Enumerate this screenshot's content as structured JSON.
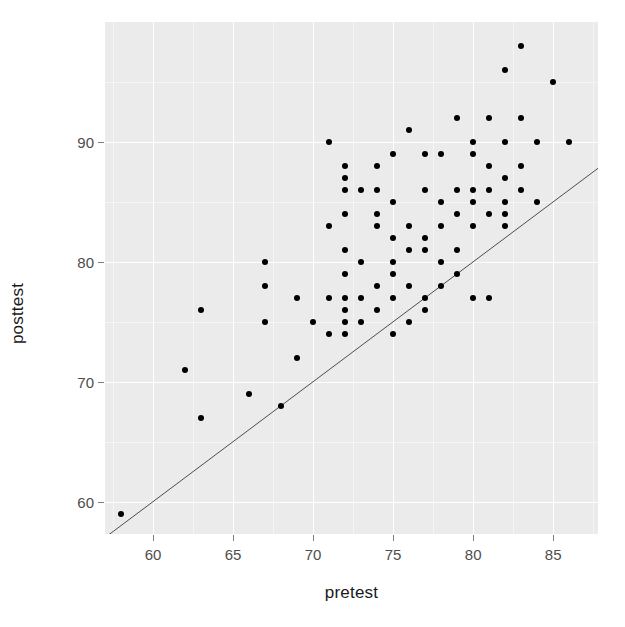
{
  "chart_data": {
    "type": "scatter",
    "title": "",
    "xlabel": "pretest",
    "ylabel": "posttest",
    "xlim": [
      57.0,
      87.8
    ],
    "ylim": [
      57.3,
      100.0
    ],
    "xticks": [
      60,
      65,
      70,
      75,
      80,
      85
    ],
    "yticks": [
      60,
      70,
      80,
      90
    ],
    "xminor": [
      57.5,
      62.5,
      67.5,
      72.5,
      77.5,
      82.5,
      87.5
    ],
    "yminor": [
      65,
      75,
      85,
      95
    ],
    "grid": true,
    "legend": null,
    "panel_background": "#ebebeb",
    "grid_major_color": "#ffffff",
    "grid_minor_color": "#f5f5f5",
    "point_color": "#000000",
    "point_size": 6,
    "annotations": [
      {
        "kind": "reference-line",
        "description": "identity line y = x",
        "from": [
          57.0,
          57.0
        ],
        "to": [
          87.8,
          87.8
        ],
        "color": "#4d4d4d",
        "width": 1
      }
    ],
    "x": [
      58,
      62,
      63,
      63,
      66,
      67,
      67,
      67,
      68,
      69,
      69,
      70,
      71,
      71,
      71,
      71,
      72,
      72,
      72,
      72,
      72,
      72,
      72,
      72,
      72,
      72,
      73,
      73,
      73,
      73,
      74,
      74,
      74,
      74,
      74,
      74,
      75,
      75,
      75,
      75,
      75,
      75,
      75,
      76,
      76,
      76,
      76,
      76,
      77,
      77,
      77,
      77,
      77,
      77,
      78,
      78,
      78,
      78,
      78,
      79,
      79,
      79,
      79,
      79,
      80,
      80,
      80,
      80,
      80,
      80,
      81,
      81,
      81,
      81,
      81,
      82,
      82,
      82,
      82,
      82,
      82,
      83,
      83,
      83,
      83,
      84,
      84,
      85,
      86
    ],
    "y": [
      59,
      71,
      76,
      67,
      69,
      80,
      78,
      75,
      68,
      77,
      72,
      75,
      90,
      83,
      77,
      74,
      88,
      87,
      86,
      84,
      81,
      79,
      77,
      76,
      75,
      74,
      86,
      80,
      77,
      75,
      88,
      86,
      84,
      83,
      78,
      76,
      89,
      85,
      82,
      80,
      79,
      77,
      74,
      91,
      83,
      81,
      78,
      75,
      89,
      86,
      82,
      81,
      77,
      76,
      89,
      85,
      83,
      80,
      78,
      92,
      86,
      84,
      81,
      79,
      90,
      89,
      86,
      85,
      83,
      77,
      92,
      88,
      86,
      84,
      77,
      96,
      90,
      87,
      85,
      84,
      83,
      98,
      92,
      88,
      86,
      90,
      85,
      95,
      90
    ]
  },
  "figure": {
    "width": 625,
    "height": 627
  }
}
